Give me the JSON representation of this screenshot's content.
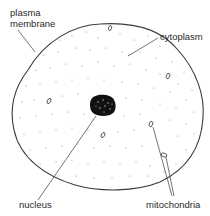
{
  "diagram": {
    "labels": {
      "plasma_membrane_line1": "plasma",
      "plasma_membrane_line2": "membrane",
      "cytoplasm": "cytoplasm",
      "nucleus": "nucleus",
      "mitochondria": "mitochondria"
    },
    "colors": {
      "outline": "#3a3a3a",
      "nucleus_fill": "#111111",
      "dots": "#8a8a8a",
      "leader_line": "#3a3a3a",
      "text": "#2a2a2a"
    },
    "components": [
      "plasma membrane",
      "cytoplasm",
      "nucleus",
      "mitochondria"
    ]
  }
}
